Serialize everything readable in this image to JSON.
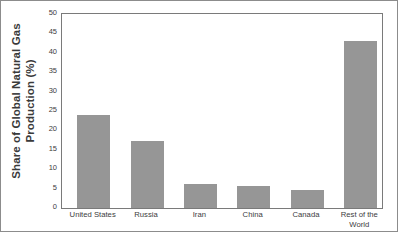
{
  "chart_data": {
    "type": "bar",
    "title": "",
    "xlabel": "",
    "ylabel": "Share of Global Natural Gas Production (%)",
    "ylabel_line1": "Share of Global Natural Gas",
    "ylabel_line2": "Production (%)",
    "categories": [
      "United States",
      "Russia",
      "Iran",
      "China",
      "Canada",
      "Rest of the World"
    ],
    "category_lines": [
      [
        "United States"
      ],
      [
        "Russia"
      ],
      [
        "Iran"
      ],
      [
        "China"
      ],
      [
        "Canada"
      ],
      [
        "Rest of the",
        "World"
      ]
    ],
    "values": [
      24,
      17.3,
      6.2,
      5.7,
      4.6,
      43
    ],
    "ylim": [
      0,
      50
    ],
    "ytick_step": 5,
    "yticks": [
      0,
      5,
      10,
      15,
      20,
      25,
      30,
      35,
      40,
      45,
      50
    ],
    "ytick_labels": [
      "0",
      "5",
      "10",
      "15",
      "20",
      "25",
      "30",
      "35",
      "40",
      "45",
      "50"
    ],
    "grid": false,
    "legend": false,
    "bar_color": "#969696",
    "axis_color": "#7a7a7a",
    "text_color": "#3d3d3d"
  }
}
